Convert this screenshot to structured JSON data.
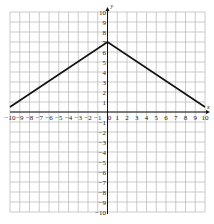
{
  "chart_data": {
    "type": "line",
    "title": "",
    "xlabel": "x",
    "ylabel": "y",
    "xlim": [
      -10,
      10
    ],
    "ylim": [
      -10,
      10
    ],
    "grid": true,
    "x_ticks": [
      -10,
      -9,
      -8,
      -7,
      -6,
      -5,
      -4,
      -3,
      -2,
      -1,
      0,
      1,
      2,
      3,
      4,
      5,
      6,
      7,
      8,
      9,
      10
    ],
    "y_ticks": [
      -10,
      -9,
      -8,
      -7,
      -6,
      -5,
      -4,
      -3,
      -2,
      -1,
      1,
      2,
      3,
      4,
      5,
      6,
      7,
      8,
      9,
      10
    ],
    "series": [
      {
        "name": "piecewise linear",
        "x": [
          -10,
          0,
          10
        ],
        "y": [
          0.5,
          7,
          0.5
        ]
      }
    ],
    "colors": {
      "grid": "#bdbdbd",
      "axis": "#111111",
      "line": "#111111"
    }
  }
}
